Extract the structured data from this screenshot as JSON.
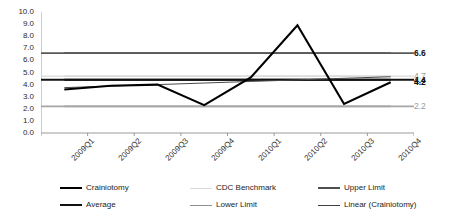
{
  "chart_data": {
    "type": "line",
    "title": "",
    "xlabel": "",
    "ylabel": "",
    "ylim": [
      0.0,
      10.0
    ],
    "ytick_step": 1.0,
    "grid": false,
    "legend_position": "bottom",
    "categories": [
      "2009Q1",
      "2009Q2",
      "2009Q3",
      "2009Q4",
      "2010Q1",
      "2010Q2",
      "2010Q3",
      "2010Q4"
    ],
    "ytick_labels": [
      "10.0",
      "9.0",
      "8.0",
      "7.0",
      "6.0",
      "5.0",
      "4.0",
      "3.0",
      "2.0",
      "1.0",
      "0.0"
    ],
    "series": [
      {
        "name": "Crainiotomy",
        "color": "#000000",
        "width": 2.1,
        "values": [
          3.6,
          3.9,
          4.0,
          2.3,
          4.6,
          8.9,
          2.4,
          4.2
        ],
        "end_label": "4.2"
      },
      {
        "name": "CDC Benchmark",
        "color": "#d9d9d9",
        "width": 1.4,
        "values": [
          4.7,
          4.7,
          4.7,
          4.7,
          4.7,
          4.7,
          4.7,
          4.7
        ],
        "end_label": "4.7"
      },
      {
        "name": "Upper Limit",
        "color": "#595959",
        "width": 1.8,
        "values": [
          6.6,
          6.6,
          6.6,
          6.6,
          6.6,
          6.6,
          6.6,
          6.6
        ],
        "end_label": "6.6"
      },
      {
        "name": "Average",
        "color": "#111111",
        "width": 1.8,
        "values": [
          4.4,
          4.4,
          4.4,
          4.4,
          4.4,
          4.4,
          4.4,
          4.4
        ],
        "end_label": "4.4"
      },
      {
        "name": "Lower Limit",
        "color": "#a6a6a6",
        "width": 1.6,
        "values": [
          2.2,
          2.2,
          2.2,
          2.2,
          2.2,
          2.2,
          2.2,
          2.2
        ],
        "end_label": "2.2"
      },
      {
        "name": "Linear (Crainiotomy)",
        "color": "#4a4a4a",
        "width": 1.0,
        "values": [
          3.75,
          3.88,
          4.0,
          4.13,
          4.26,
          4.39,
          4.52,
          4.65
        ],
        "end_label": ""
      }
    ],
    "right_value_labels": [
      {
        "text": "6.6",
        "value": 6.6,
        "style": "bold"
      },
      {
        "text": "4.7",
        "value": 4.7,
        "style": "muted"
      },
      {
        "text": "4.4",
        "value": 4.4,
        "style": "bold"
      },
      {
        "text": "4.2",
        "value": 4.2,
        "style": "bold"
      },
      {
        "text": "2.2",
        "value": 2.2,
        "style": "muted"
      }
    ],
    "legend": [
      {
        "label": "Crainiotomy",
        "color": "#000000",
        "width": 2.4,
        "col": 0,
        "row": 0
      },
      {
        "label": "Average",
        "color": "#111111",
        "width": 2.2,
        "col": 0,
        "row": 1
      },
      {
        "label": "CDC Benchmark",
        "color": "#dadada",
        "width": 1.6,
        "col": 1,
        "row": 0
      },
      {
        "label": "Lower Limit",
        "color": "#8f8f8f",
        "width": 1.8,
        "col": 1,
        "row": 1
      },
      {
        "label": "Upper Limit",
        "color": "#4f4f4f",
        "width": 2.0,
        "col": 2,
        "row": 0
      },
      {
        "label": "Linear (Crainiotomy)",
        "color": "#3f3f3f",
        "width": 1.8,
        "col": 2,
        "row": 1
      }
    ],
    "axis_color": "#9b9b9b"
  }
}
